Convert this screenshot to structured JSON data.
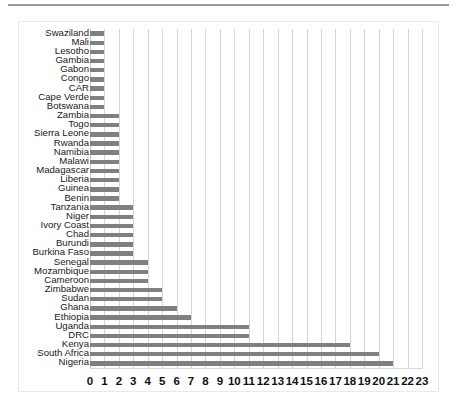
{
  "chart_data": {
    "type": "bar",
    "orientation": "horizontal",
    "title": "",
    "subtitle": "",
    "xlabel": "",
    "ylabel": "",
    "xlim": [
      0,
      23
    ],
    "grid": true,
    "legend": false,
    "bar_color": "#808080",
    "gridline_color": "#d5d5d5",
    "xticks": [
      0,
      1,
      2,
      3,
      4,
      5,
      6,
      7,
      8,
      9,
      10,
      11,
      12,
      13,
      14,
      15,
      16,
      17,
      18,
      19,
      20,
      21,
      22,
      23
    ],
    "categories": [
      "Swaziland",
      "Mali",
      "Lesotho",
      "Gambia",
      "Gabon",
      "Congo",
      "CAR",
      "Cape Verde",
      "Botswana",
      "Zambia",
      "Togo",
      "Sierra Leone",
      "Rwanda",
      "Namibia",
      "Malawi",
      "Madagascar",
      "Liberia",
      "Guinea",
      "Benin",
      "Tanzania",
      "Niger",
      "Ivory Coast",
      "Chad",
      "Burundi",
      "Burkina Faso",
      "Senegal",
      "Mozambique",
      "Cameroon",
      "Zimbabwe",
      "Sudan",
      "Ghana",
      "Ethiopia",
      "Uganda",
      "DRC",
      "Kenya",
      "South Africa",
      "Nigeria"
    ],
    "values": [
      1,
      1,
      1,
      1,
      1,
      1,
      1,
      1,
      1,
      2,
      2,
      2,
      2,
      2,
      2,
      2,
      2,
      2,
      2,
      3,
      3,
      3,
      3,
      3,
      3,
      4,
      4,
      4,
      5,
      5,
      6,
      7,
      11,
      11,
      18,
      20,
      21
    ]
  }
}
